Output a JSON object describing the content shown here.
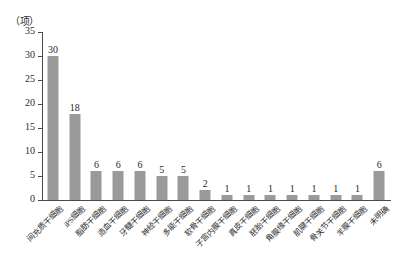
{
  "chart_data": {
    "type": "bar",
    "title": "",
    "subtitle": "",
    "xlabel": "",
    "ylabel": "",
    "unit_label": "（项）",
    "ylim": [
      0,
      35
    ],
    "ytick_step": 5,
    "yticks": [
      "0",
      "5",
      "10",
      "15",
      "20",
      "25",
      "30",
      "35"
    ],
    "grid": false,
    "legend": false,
    "bar_color": "#9a9a9a",
    "axis_color": "#4a4a4a",
    "categories": [
      "间充质干细胞",
      "iPS细胞",
      "脂肪干细胞",
      "造血干细胞",
      "牙髓干细胞",
      "神经干细胞",
      "多能干细胞",
      "软骨干细胞",
      "子宫内膜干细胞",
      "真皮干细胞",
      "胚胎干细胞",
      "角膜缘干细胞",
      "肌腱干细胞",
      "骨关节干细胞",
      "羊膜干细胞",
      "未明确"
    ],
    "values": [
      30,
      18,
      6,
      6,
      6,
      5,
      5,
      2,
      1,
      1,
      1,
      1,
      1,
      1,
      1,
      6
    ],
    "value_labels": [
      "30",
      "18",
      "6",
      "6",
      "6",
      "5",
      "5",
      "2",
      "1",
      "1",
      "1",
      "1",
      "1",
      "1",
      "1",
      "6"
    ]
  }
}
